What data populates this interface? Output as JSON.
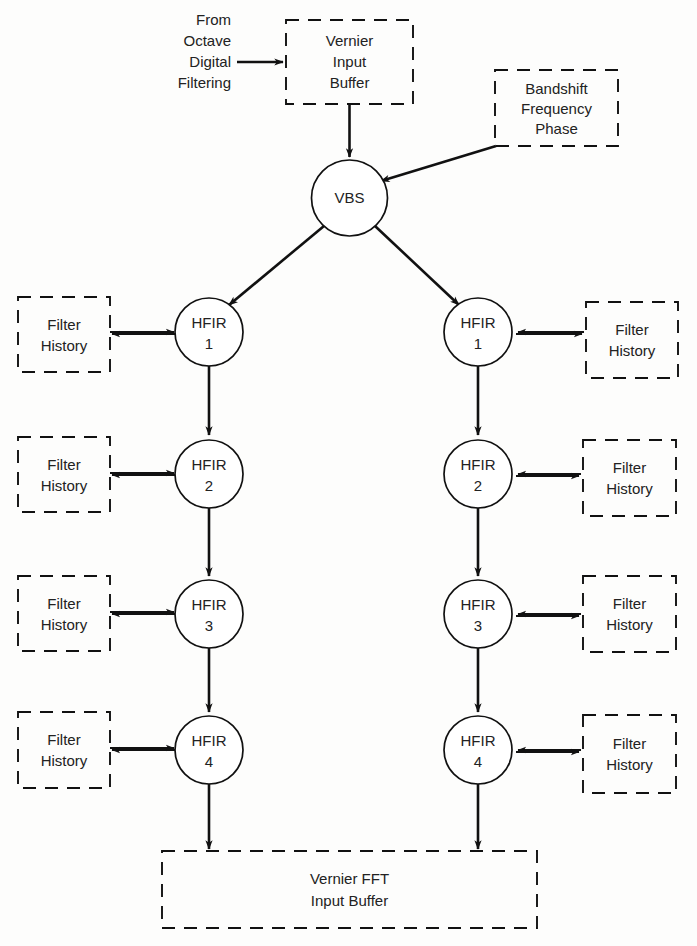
{
  "diagram": {
    "colors": {
      "background": "#fdfdfc",
      "stroke": "#111111",
      "text": "#222222"
    },
    "source_label": {
      "line1": "From",
      "line2": "Octave",
      "line3": "Digital",
      "line4": "Filtering"
    },
    "boxes": {
      "vernier_input_buffer": {
        "line1": "Vernier",
        "line2": "Input",
        "line3": "Buffer"
      },
      "bandshift": {
        "line1": "Bandshift",
        "line2": "Frequency",
        "line3": "Phase"
      },
      "vernier_fft_input_buffer": {
        "line1": "Vernier FFT",
        "line2": "Input Buffer"
      },
      "filter_history": {
        "line1": "Filter",
        "line2": "History"
      }
    },
    "nodes": {
      "vbs": {
        "label": "VBS"
      },
      "hfir": {
        "name": "HFIR",
        "stages": [
          "1",
          "2",
          "3",
          "4"
        ]
      }
    },
    "left_branch": {
      "stages": [
        {
          "name": "HFIR",
          "index": "1",
          "history": {
            "line1": "Filter",
            "line2": "History"
          }
        },
        {
          "name": "HFIR",
          "index": "2",
          "history": {
            "line1": "Filter",
            "line2": "History"
          }
        },
        {
          "name": "HFIR",
          "index": "3",
          "history": {
            "line1": "Filter",
            "line2": "History"
          }
        },
        {
          "name": "HFIR",
          "index": "4",
          "history": {
            "line1": "Filter",
            "line2": "History"
          }
        }
      ]
    },
    "right_branch": {
      "stages": [
        {
          "name": "HFIR",
          "index": "1",
          "history": {
            "line1": "Filter",
            "line2": "History"
          }
        },
        {
          "name": "HFIR",
          "index": "2",
          "history": {
            "line1": "Filter",
            "line2": "History"
          }
        },
        {
          "name": "HFIR",
          "index": "3",
          "history": {
            "line1": "Filter",
            "line2": "History"
          }
        },
        {
          "name": "HFIR",
          "index": "4",
          "history": {
            "line1": "Filter",
            "line2": "History"
          }
        }
      ]
    }
  }
}
